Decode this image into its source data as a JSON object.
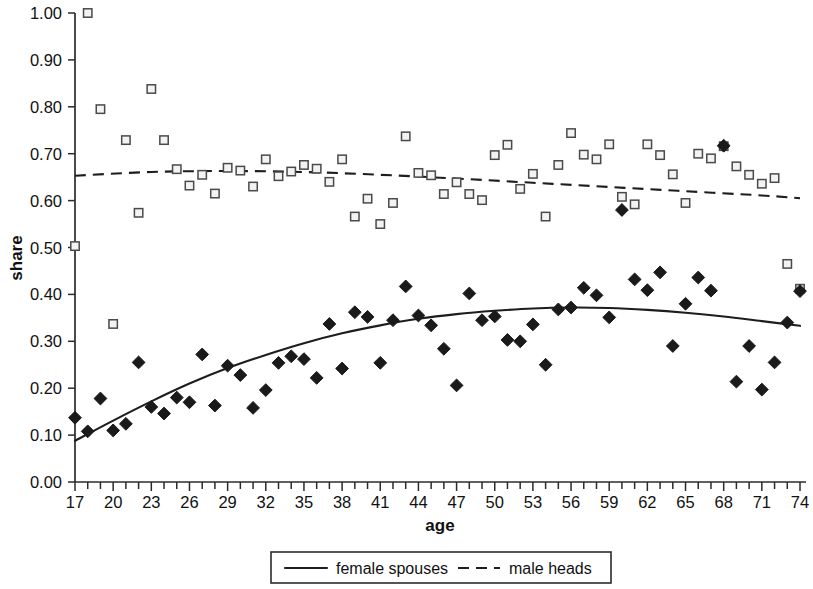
{
  "chart_data": {
    "type": "scatter",
    "title": "",
    "xlabel": "age",
    "ylabel": "share",
    "xlim": [
      17,
      74
    ],
    "ylim": [
      0.0,
      1.0
    ],
    "grid": false,
    "legend_position": "bottom",
    "x_tick_labels": [
      "17",
      "20",
      "23",
      "26",
      "29",
      "32",
      "35",
      "38",
      "41",
      "44",
      "47",
      "50",
      "53",
      "56",
      "59",
      "62",
      "65",
      "68",
      "71",
      "74"
    ],
    "x_tick_step_minor": 1,
    "x_tick_step_major": 3,
    "y_tick_labels": [
      "0.00",
      "0.10",
      "0.20",
      "0.30",
      "0.40",
      "0.50",
      "0.60",
      "0.70",
      "0.80",
      "0.90",
      "1.00"
    ],
    "y_tick_step": 0.1,
    "series": [
      {
        "name": "female spouses",
        "marker": "filled-diamond",
        "line_style": "solid",
        "color": "#1a1a1a",
        "points": [
          {
            "x": 17,
            "y": 0.137
          },
          {
            "x": 18,
            "y": 0.108
          },
          {
            "x": 19,
            "y": 0.178
          },
          {
            "x": 20,
            "y": 0.11
          },
          {
            "x": 21,
            "y": 0.124
          },
          {
            "x": 22,
            "y": 0.255
          },
          {
            "x": 23,
            "y": 0.16
          },
          {
            "x": 24,
            "y": 0.146
          },
          {
            "x": 25,
            "y": 0.18
          },
          {
            "x": 26,
            "y": 0.17
          },
          {
            "x": 27,
            "y": 0.272
          },
          {
            "x": 28,
            "y": 0.163
          },
          {
            "x": 29,
            "y": 0.248
          },
          {
            "x": 30,
            "y": 0.228
          },
          {
            "x": 31,
            "y": 0.158
          },
          {
            "x": 32,
            "y": 0.196
          },
          {
            "x": 33,
            "y": 0.254
          },
          {
            "x": 34,
            "y": 0.268
          },
          {
            "x": 35,
            "y": 0.262
          },
          {
            "x": 36,
            "y": 0.222
          },
          {
            "x": 37,
            "y": 0.337
          },
          {
            "x": 38,
            "y": 0.242
          },
          {
            "x": 39,
            "y": 0.362
          },
          {
            "x": 40,
            "y": 0.352
          },
          {
            "x": 41,
            "y": 0.254
          },
          {
            "x": 42,
            "y": 0.345
          },
          {
            "x": 43,
            "y": 0.417
          },
          {
            "x": 44,
            "y": 0.355
          },
          {
            "x": 45,
            "y": 0.334
          },
          {
            "x": 46,
            "y": 0.284
          },
          {
            "x": 47,
            "y": 0.206
          },
          {
            "x": 48,
            "y": 0.402
          },
          {
            "x": 49,
            "y": 0.345
          },
          {
            "x": 50,
            "y": 0.353
          },
          {
            "x": 51,
            "y": 0.303
          },
          {
            "x": 52,
            "y": 0.3
          },
          {
            "x": 53,
            "y": 0.336
          },
          {
            "x": 54,
            "y": 0.25
          },
          {
            "x": 55,
            "y": 0.368
          },
          {
            "x": 56,
            "y": 0.372
          },
          {
            "x": 57,
            "y": 0.414
          },
          {
            "x": 58,
            "y": 0.398
          },
          {
            "x": 59,
            "y": 0.351
          },
          {
            "x": 60,
            "y": 0.58
          },
          {
            "x": 61,
            "y": 0.432
          },
          {
            "x": 62,
            "y": 0.409
          },
          {
            "x": 63,
            "y": 0.447
          },
          {
            "x": 64,
            "y": 0.29
          },
          {
            "x": 65,
            "y": 0.38
          },
          {
            "x": 66,
            "y": 0.436
          },
          {
            "x": 67,
            "y": 0.408
          },
          {
            "x": 68,
            "y": 0.717
          },
          {
            "x": 69,
            "y": 0.214
          },
          {
            "x": 70,
            "y": 0.29
          },
          {
            "x": 71,
            "y": 0.197
          },
          {
            "x": 72,
            "y": 0.255
          },
          {
            "x": 73,
            "y": 0.34
          },
          {
            "x": 74,
            "y": 0.407
          }
        ],
        "fit_curve": [
          {
            "x": 17,
            "y": 0.088
          },
          {
            "x": 20,
            "y": 0.131
          },
          {
            "x": 23,
            "y": 0.172
          },
          {
            "x": 26,
            "y": 0.21
          },
          {
            "x": 29,
            "y": 0.243
          },
          {
            "x": 32,
            "y": 0.271
          },
          {
            "x": 35,
            "y": 0.296
          },
          {
            "x": 38,
            "y": 0.317
          },
          {
            "x": 41,
            "y": 0.334
          },
          {
            "x": 44,
            "y": 0.348
          },
          {
            "x": 47,
            "y": 0.358
          },
          {
            "x": 50,
            "y": 0.365
          },
          {
            "x": 53,
            "y": 0.37
          },
          {
            "x": 56,
            "y": 0.372
          },
          {
            "x": 59,
            "y": 0.371
          },
          {
            "x": 62,
            "y": 0.367
          },
          {
            "x": 65,
            "y": 0.361
          },
          {
            "x": 68,
            "y": 0.353
          },
          {
            "x": 71,
            "y": 0.343
          },
          {
            "x": 74,
            "y": 0.333
          }
        ]
      },
      {
        "name": "male heads",
        "marker": "open-square",
        "line_style": "dashed",
        "color": "#4a4a4a",
        "points": [
          {
            "x": 17,
            "y": 0.503
          },
          {
            "x": 18,
            "y": 1.0
          },
          {
            "x": 19,
            "y": 0.795
          },
          {
            "x": 20,
            "y": 0.337
          },
          {
            "x": 21,
            "y": 0.729
          },
          {
            "x": 22,
            "y": 0.574
          },
          {
            "x": 23,
            "y": 0.838
          },
          {
            "x": 24,
            "y": 0.729
          },
          {
            "x": 25,
            "y": 0.667
          },
          {
            "x": 26,
            "y": 0.632
          },
          {
            "x": 27,
            "y": 0.655
          },
          {
            "x": 28,
            "y": 0.615
          },
          {
            "x": 29,
            "y": 0.67
          },
          {
            "x": 30,
            "y": 0.664
          },
          {
            "x": 31,
            "y": 0.63
          },
          {
            "x": 32,
            "y": 0.688
          },
          {
            "x": 33,
            "y": 0.652
          },
          {
            "x": 34,
            "y": 0.662
          },
          {
            "x": 35,
            "y": 0.676
          },
          {
            "x": 36,
            "y": 0.668
          },
          {
            "x": 37,
            "y": 0.64
          },
          {
            "x": 38,
            "y": 0.688
          },
          {
            "x": 39,
            "y": 0.566
          },
          {
            "x": 40,
            "y": 0.604
          },
          {
            "x": 41,
            "y": 0.55
          },
          {
            "x": 42,
            "y": 0.595
          },
          {
            "x": 43,
            "y": 0.737
          },
          {
            "x": 44,
            "y": 0.659
          },
          {
            "x": 45,
            "y": 0.654
          },
          {
            "x": 46,
            "y": 0.614
          },
          {
            "x": 47,
            "y": 0.639
          },
          {
            "x": 48,
            "y": 0.614
          },
          {
            "x": 49,
            "y": 0.601
          },
          {
            "x": 50,
            "y": 0.697
          },
          {
            "x": 51,
            "y": 0.719
          },
          {
            "x": 52,
            "y": 0.625
          },
          {
            "x": 53,
            "y": 0.657
          },
          {
            "x": 54,
            "y": 0.566
          },
          {
            "x": 55,
            "y": 0.676
          },
          {
            "x": 56,
            "y": 0.744
          },
          {
            "x": 57,
            "y": 0.698
          },
          {
            "x": 58,
            "y": 0.688
          },
          {
            "x": 59,
            "y": 0.72
          },
          {
            "x": 60,
            "y": 0.608
          },
          {
            "x": 61,
            "y": 0.592
          },
          {
            "x": 62,
            "y": 0.72
          },
          {
            "x": 63,
            "y": 0.697
          },
          {
            "x": 64,
            "y": 0.656
          },
          {
            "x": 65,
            "y": 0.595
          },
          {
            "x": 66,
            "y": 0.7
          },
          {
            "x": 67,
            "y": 0.69
          },
          {
            "x": 68,
            "y": 0.716
          },
          {
            "x": 69,
            "y": 0.673
          },
          {
            "x": 70,
            "y": 0.655
          },
          {
            "x": 71,
            "y": 0.636
          },
          {
            "x": 72,
            "y": 0.648
          },
          {
            "x": 73,
            "y": 0.465
          },
          {
            "x": 74,
            "y": 0.412
          }
        ],
        "fit_curve": [
          {
            "x": 17,
            "y": 0.653
          },
          {
            "x": 23,
            "y": 0.661
          },
          {
            "x": 29,
            "y": 0.663
          },
          {
            "x": 35,
            "y": 0.661
          },
          {
            "x": 41,
            "y": 0.655
          },
          {
            "x": 47,
            "y": 0.647
          },
          {
            "x": 53,
            "y": 0.638
          },
          {
            "x": 59,
            "y": 0.629
          },
          {
            "x": 65,
            "y": 0.62
          },
          {
            "x": 71,
            "y": 0.611
          },
          {
            "x": 74,
            "y": 0.605
          }
        ]
      }
    ]
  },
  "legend": {
    "items": [
      {
        "label": "female spouses",
        "style": "solid"
      },
      {
        "label": "male heads",
        "style": "dashed"
      }
    ]
  }
}
